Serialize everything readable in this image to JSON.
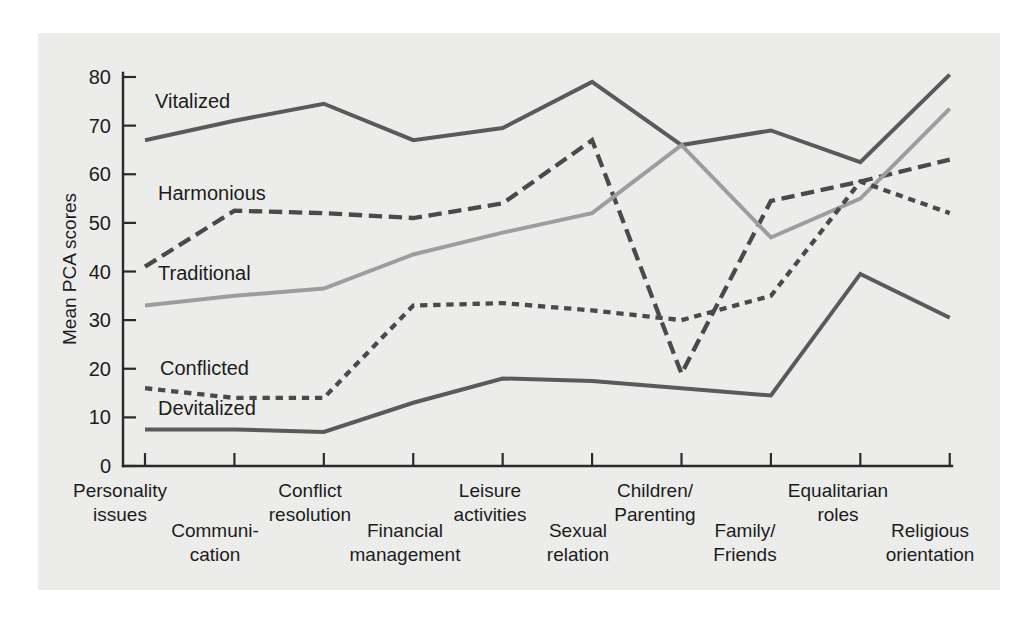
{
  "chart_data": {
    "type": "line",
    "title": "",
    "xlabel": "",
    "ylabel": "Mean PCA scores",
    "ylim": [
      0,
      80
    ],
    "yticks": [
      0,
      10,
      20,
      30,
      40,
      50,
      60,
      70,
      80
    ],
    "grid": false,
    "legend": "inline-labels",
    "categories": [
      "Personality issues",
      "Communi-cation",
      "Conflict resolution",
      "Financial management",
      "Leisure activities",
      "Sexual relation",
      "Children/ Parenting",
      "Family/ Friends",
      "Equalitarian roles",
      "Religious orientation"
    ],
    "series": [
      {
        "name": "Vitalized",
        "color": "#5a5a5a",
        "style": "solid",
        "values": [
          67,
          71,
          74.5,
          67,
          69.5,
          79,
          66,
          69,
          62.5,
          80.5
        ]
      },
      {
        "name": "Harmonious",
        "color": "#4a4a4a",
        "style": "dashed",
        "values": [
          41,
          52.5,
          52,
          51,
          54,
          67,
          19,
          54.5,
          58.5,
          63
        ]
      },
      {
        "name": "Traditional",
        "color": "#9d9d9d",
        "style": "solid",
        "values": [
          33,
          35,
          36.5,
          43.5,
          48,
          52,
          66,
          47,
          55,
          73.5
        ]
      },
      {
        "name": "Conflicted",
        "color": "#4a4a4a",
        "style": "dotted",
        "values": [
          16,
          14,
          14,
          33,
          33.5,
          32,
          30,
          35,
          58.5,
          52
        ]
      },
      {
        "name": "Devitalized",
        "color": "#5a5a5a",
        "style": "solid",
        "values": [
          7.5,
          7.5,
          7,
          13,
          18,
          17.5,
          16,
          14.5,
          39.5,
          30.5
        ]
      }
    ],
    "series_label_positions": [
      {
        "name": "Vitalized",
        "x": 155,
        "y": 108
      },
      {
        "name": "Harmonious",
        "x": 158,
        "y": 200
      },
      {
        "name": "Traditional",
        "x": 158,
        "y": 280
      },
      {
        "name": "Conflicted",
        "x": 160,
        "y": 375
      },
      {
        "name": "Devitalized",
        "x": 158,
        "y": 415
      }
    ],
    "category_label_layout": [
      {
        "line1": "Personality",
        "line2": "issues",
        "x": 120,
        "y": 497,
        "row": "top"
      },
      {
        "line1": "Communi-",
        "line2": "cation",
        "x": 215,
        "y": 537,
        "row": "bottom"
      },
      {
        "line1": "Conflict",
        "line2": "resolution",
        "x": 310,
        "y": 497,
        "row": "top"
      },
      {
        "line1": "Financial",
        "line2": "management",
        "x": 405,
        "y": 537,
        "row": "bottom"
      },
      {
        "line1": "Leisure",
        "line2": "activities",
        "x": 490,
        "y": 497,
        "row": "top"
      },
      {
        "line1": "Sexual",
        "line2": "relation",
        "x": 578,
        "y": 537,
        "row": "bottom"
      },
      {
        "line1": "Children/",
        "line2": "Parenting",
        "x": 655,
        "y": 497,
        "row": "top"
      },
      {
        "line1": "Family/",
        "line2": "Friends",
        "x": 745,
        "y": 537,
        "row": "bottom"
      },
      {
        "line1": "Equalitarian",
        "line2": "roles",
        "x": 838,
        "y": 497,
        "row": "top"
      },
      {
        "line1": "Religious",
        "line2": "orientation",
        "x": 930,
        "y": 537,
        "row": "bottom"
      }
    ]
  },
  "colors": {
    "background": "#ffffff",
    "scan": "#ececeb",
    "axis": "#2a2a2a",
    "dark_line": "#5a5a5a",
    "darkest_line": "#4a4a4a",
    "light_line": "#9d9d9d"
  }
}
